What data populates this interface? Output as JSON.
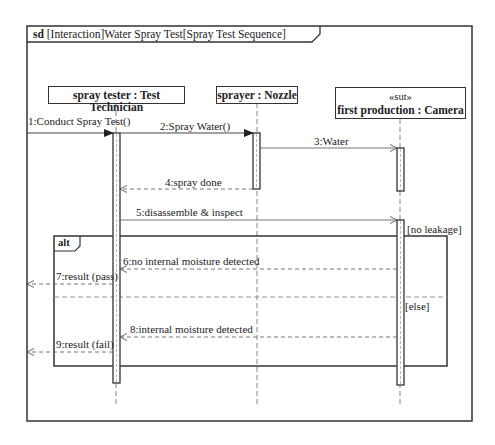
{
  "frame": {
    "keyword": "sd",
    "title": " [Interaction]Water Spray Test[Spray Test Sequence]"
  },
  "lifelines": [
    {
      "id": "tester",
      "name": "spray tester : Test Technician",
      "stereotype": ""
    },
    {
      "id": "sprayer",
      "name": "sprayer : Nozzle",
      "stereotype": ""
    },
    {
      "id": "camera",
      "name": "first production : Camera",
      "stereotype": "«sut»"
    }
  ],
  "messages": [
    {
      "n": 1,
      "label": "1:Conduct Spray Test()",
      "from": "gate",
      "to": "tester",
      "type": "sync"
    },
    {
      "n": 2,
      "label": "2:Spray Water()",
      "from": "tester",
      "to": "sprayer",
      "type": "sync"
    },
    {
      "n": 3,
      "label": "3:Water",
      "from": "sprayer",
      "to": "camera",
      "type": "async"
    },
    {
      "n": 4,
      "label": "4:spray done",
      "from": "sprayer",
      "to": "tester",
      "type": "reply"
    },
    {
      "n": 5,
      "label": "5:disassemble & inspect",
      "from": "tester",
      "to": "camera",
      "type": "async"
    },
    {
      "n": 6,
      "label": "6:no internal moisture detected",
      "from": "camera",
      "to": "tester",
      "type": "reply"
    },
    {
      "n": 7,
      "label": "7:result (pass)",
      "from": "tester",
      "to": "gate",
      "type": "reply"
    },
    {
      "n": 8,
      "label": "8:internal moisture detected",
      "from": "camera",
      "to": "tester",
      "type": "reply"
    },
    {
      "n": 9,
      "label": "9:result (fail)",
      "from": "tester",
      "to": "gate",
      "type": "reply"
    }
  ],
  "fragment": {
    "operator": "alt",
    "guards": [
      "[no leakage]",
      "[else]"
    ]
  }
}
